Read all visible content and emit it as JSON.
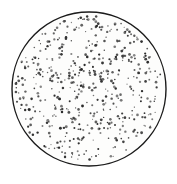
{
  "figure": {
    "kind": "stippled-circle-scatter",
    "title": "",
    "caption": "",
    "background_color": "#ffffff",
    "canvas": {
      "width": 177,
      "height": 184
    }
  },
  "circle": {
    "name": "dish-boundary",
    "center_x": 89,
    "center_y": 89,
    "radius": 77,
    "stroke_color": "#1b1b1b",
    "stroke_width": 1.4,
    "fill_color": "#fdfdfc"
  },
  "chart_data": {
    "type": "scatter",
    "title": "",
    "subtitle": "",
    "xlabel": "",
    "ylabel": "",
    "xlim": [
      12,
      166
    ],
    "ylim": [
      12,
      166
    ],
    "grid": false,
    "legend": null,
    "annotations": [],
    "marker": {
      "shape": "circle",
      "color": "#2a2a2a",
      "min_radius": 0.55,
      "max_radius": 1.45
    },
    "point_count": 512,
    "distribution": "uniform-random-within-circle",
    "boundary": {
      "shape": "circle",
      "cx": 89,
      "cy": 89,
      "r": 77
    },
    "seed": 20250514
  }
}
